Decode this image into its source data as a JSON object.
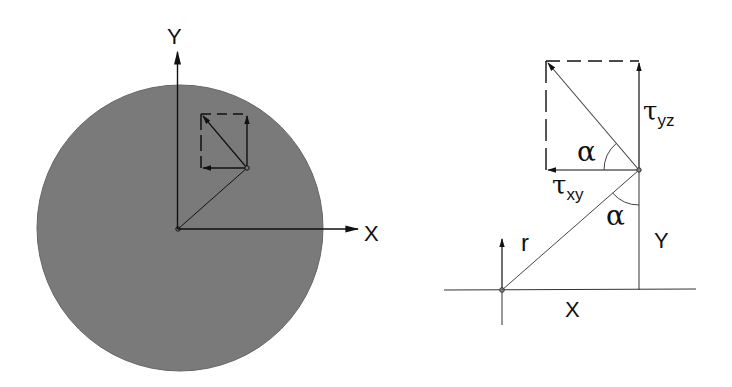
{
  "left_diagram": {
    "title": "Circular cross-section with shear stress components",
    "axis_x_label": "X",
    "axis_y_label": "Y",
    "fill_color": "#7a7a7a"
  },
  "right_diagram": {
    "title": "Shear stress decomposition detail",
    "tau_yz": {
      "symbol": "τ",
      "subscript": "yz"
    },
    "tau_xy": {
      "symbol": "τ",
      "subscript": "xy"
    },
    "alpha_top": "α",
    "alpha_bottom": "α",
    "radius_label": "r",
    "x_label": "X",
    "y_label": "Y"
  }
}
